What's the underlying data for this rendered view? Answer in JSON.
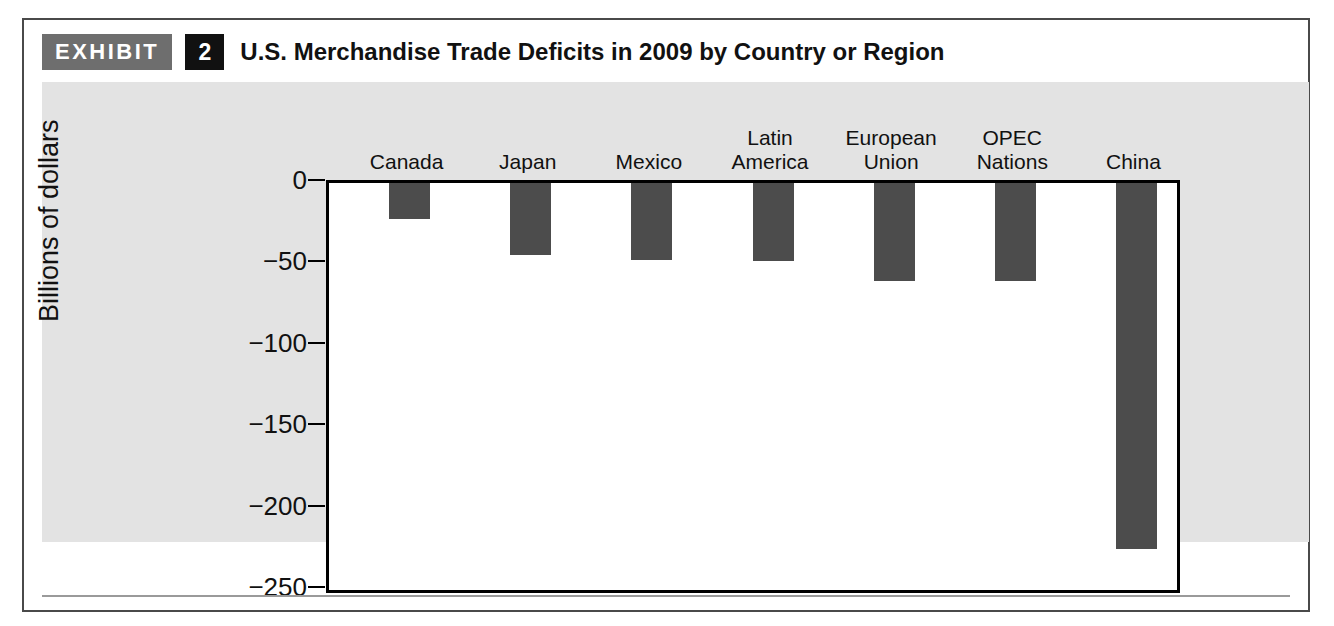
{
  "exhibit": {
    "badge_label": "EXHIBIT",
    "number": "2",
    "title": "U.S. Merchandise Trade Deficits in 2009 by Country or Region"
  },
  "colors": {
    "bar": "#4c4c4c",
    "badge_gray": "#6e6e6e",
    "badge_black": "#111111",
    "panel_background": "#e3e3e3",
    "plot_background": "#ffffff",
    "axis": "#000000"
  },
  "chart_data": {
    "type": "bar",
    "title": "U.S. Merchandise Trade Deficits in 2009 by Country or Region",
    "xlabel": "",
    "ylabel": "Billions of dollars",
    "categories": [
      "Canada",
      "Japan",
      "Mexico",
      "Latin America",
      "European Union",
      "OPEC Nations",
      "China"
    ],
    "category_lines": [
      [
        "Canada"
      ],
      [
        "Japan"
      ],
      [
        "Mexico"
      ],
      [
        "Latin",
        "America"
      ],
      [
        "European",
        "Union"
      ],
      [
        "OPEC",
        "Nations"
      ],
      [
        "China"
      ]
    ],
    "values": [
      -22,
      -44,
      -47,
      -48,
      -60,
      -60,
      -225
    ],
    "ylim": [
      -250,
      0
    ],
    "yticks": [
      0,
      -50,
      -100,
      -150,
      -200,
      -250
    ],
    "ytick_labels": [
      "0",
      "−50",
      "−100",
      "−150",
      "−200",
      "−250"
    ],
    "grid": false,
    "legend": null,
    "orientation": "vertical",
    "category_labels_position": "top"
  }
}
